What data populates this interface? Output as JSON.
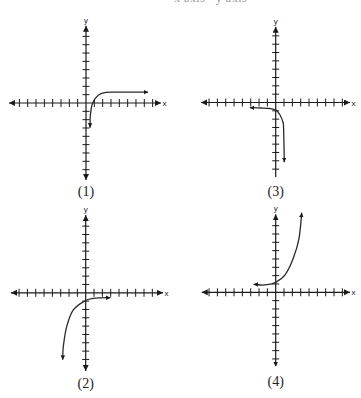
{
  "header": {
    "cropped_text": "x axis   y axis"
  },
  "colors": {
    "ink": "#1a1a1a",
    "curve": "#2a2a2a",
    "background": "#ffffff"
  },
  "chart_data": [
    {
      "id": 1,
      "type": "line",
      "title": "(1)",
      "xlabel": "x",
      "ylabel": "y",
      "grid": false,
      "origin_px": [
        86,
        103
      ],
      "unit_px": 8.33,
      "caption_y_px": 196,
      "tick_range": [
        -8,
        8
      ],
      "x_axis": {
        "min": -9.25,
        "max": 9.0,
        "arrow_min": "large",
        "arrow_max": "large"
      },
      "y_axis": {
        "min": -9.25,
        "max": 9.28,
        "arrow_min": "large",
        "arrow_max": "large"
      },
      "series": [
        {
          "name": "curve",
          "points": [
            [
              0.48,
              -2.9
            ],
            [
              0.52,
              -1.5
            ],
            [
              0.8,
              0.0
            ],
            [
              1.5,
              0.95
            ],
            [
              2.4,
              1.28
            ],
            [
              4.1,
              1.3
            ],
            [
              7.4,
              1.3
            ]
          ],
          "start_marker": true,
          "end_marker": true
        }
      ]
    },
    {
      "id": 2,
      "type": "line",
      "title": "(2)",
      "xlabel": "x",
      "ylabel": "y",
      "grid": false,
      "origin_px": [
        85.7,
        292.8
      ],
      "unit_px": 8.33,
      "caption_y_px": 388,
      "tick_range": [
        -8,
        8
      ],
      "x_axis": {
        "min": -8.97,
        "max": 9.28,
        "arrow_min": "large",
        "arrow_max": "large"
      },
      "y_axis": {
        "min": -9.39,
        "max": 9.34,
        "arrow_min": "large",
        "arrow_max": "large"
      },
      "series": [
        {
          "name": "curve",
          "points": [
            [
              2.92,
              -0.59
            ],
            [
              1.8,
              -0.6
            ],
            [
              0.9,
              -0.66
            ],
            [
              -0.08,
              -0.95
            ],
            [
              -1.49,
              -2.06
            ],
            [
              -2.28,
              -4.07
            ],
            [
              -2.69,
              -6.47
            ],
            [
              -2.76,
              -7.98
            ]
          ],
          "start_marker": true,
          "end_marker": true
        }
      ]
    },
    {
      "id": 3,
      "type": "line",
      "title": "(3)",
      "xlabel": "x",
      "ylabel": "y",
      "grid": false,
      "origin_px": [
        275.7,
        102.5
      ],
      "unit_px": 8.33,
      "caption_y_px": 196,
      "tick_range": [
        -8,
        8
      ],
      "x_axis": {
        "min": -8.97,
        "max": 8.92,
        "arrow_min": "large",
        "arrow_max": "large"
      },
      "y_axis": {
        "min": -8.95,
        "max": 9.1,
        "arrow_min": null,
        "arrow_max": "large"
      },
      "series": [
        {
          "name": "curve",
          "points": [
            [
              -3.05,
              -0.62
            ],
            [
              -1.8,
              -0.66
            ],
            [
              -0.7,
              -0.72
            ],
            [
              0.05,
              -0.92
            ],
            [
              0.52,
              -1.5
            ],
            [
              0.86,
              -2.34
            ],
            [
              0.95,
              -3.1
            ],
            [
              1.03,
              -7.1
            ]
          ],
          "start_marker": true,
          "end_marker": true
        }
      ]
    },
    {
      "id": 4,
      "type": "line",
      "title": "(4)",
      "xlabel": "x",
      "ylabel": "y",
      "grid": false,
      "origin_px": [
        275.7,
        292.3
      ],
      "unit_px": 8.33,
      "caption_y_px": 386,
      "tick_range": [
        -8,
        8
      ],
      "x_axis": {
        "min": -8.88,
        "max": 8.92,
        "arrow_min": "large",
        "arrow_max": "large"
      },
      "y_axis": {
        "min": -8.85,
        "max": 9.36,
        "arrow_min": "small",
        "arrow_max": "large"
      },
      "series": [
        {
          "name": "curve",
          "points": [
            [
              -2.6,
              0.96
            ],
            [
              -1.28,
              0.88
            ],
            [
              0.0,
              1.2
            ],
            [
              1.12,
              2.08
            ],
            [
              2.11,
              4.08
            ],
            [
              2.8,
              6.48
            ],
            [
              3.12,
              9.5
            ]
          ],
          "start_marker": true,
          "end_marker": true
        }
      ]
    }
  ]
}
